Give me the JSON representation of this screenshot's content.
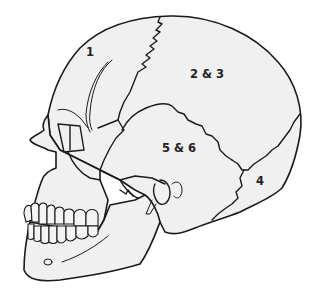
{
  "diagram": {
    "labels": [
      {
        "id": "1",
        "text": "1",
        "x": 86,
        "y": 56
      },
      {
        "id": "2-3",
        "text": "2 & 3",
        "x": 190,
        "y": 78
      },
      {
        "id": "5-6",
        "text": "5 & 6",
        "x": 162,
        "y": 152
      },
      {
        "id": "4",
        "text": "4",
        "x": 256,
        "y": 185
      }
    ],
    "colors": {
      "bone_fill": "#f0f0f0",
      "outline": "#1a1a1a",
      "background": "#ffffff"
    }
  }
}
